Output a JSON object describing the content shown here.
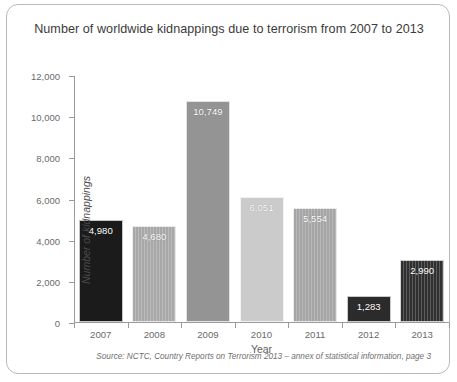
{
  "chart_data": {
    "type": "bar",
    "title": "Number of worldwide kidnappings due to terrorism from 2007 to 2013",
    "xlabel": "Year",
    "ylabel": "Number of kidnappings",
    "categories": [
      "2007",
      "2008",
      "2009",
      "2010",
      "2011",
      "2012",
      "2013"
    ],
    "values": [
      4980,
      4680,
      10749,
      6051,
      5554,
      1283,
      2990
    ],
    "value_labels": [
      "4,980",
      "4,680",
      "10,749",
      "6,051",
      "5,554",
      "1,283",
      "2,990"
    ],
    "ylim": [
      0,
      12000
    ],
    "ytick_values": [
      0,
      2000,
      4000,
      6000,
      8000,
      10000,
      12000
    ],
    "ytick_labels": [
      "0",
      "2,000",
      "4,000",
      "6,000",
      "8,000",
      "10,000",
      "12,000"
    ],
    "grid": false,
    "legend": "none",
    "bar_styles": [
      {
        "year": "2007",
        "fill": "#1b1b1b",
        "pattern": "solid"
      },
      {
        "year": "2008",
        "fill": "#a8a8a8",
        "pattern": "vertical-stripes"
      },
      {
        "year": "2009",
        "fill": "#949494",
        "pattern": "solid"
      },
      {
        "year": "2010",
        "fill": "#cbcbcb",
        "pattern": "solid"
      },
      {
        "year": "2011",
        "fill": "#a5a5a5",
        "pattern": "vertical-stripes"
      },
      {
        "year": "2012",
        "fill": "#2b2b2b",
        "pattern": "solid"
      },
      {
        "year": "2013",
        "fill": "#303030",
        "pattern": "vertical-stripes"
      }
    ],
    "source": "Source: NCTC, Country Reports on Terrorism 2013 – annex of statistical information, page 3"
  },
  "frame": {
    "border_color": "#b9b9b9",
    "background": "#ffffff",
    "axis_color": "#9a9a9a",
    "tick_label_color": "#6a6a6a"
  }
}
